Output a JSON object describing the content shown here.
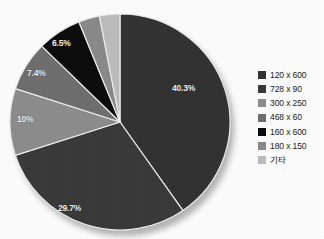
{
  "chart_data": {
    "type": "pie",
    "title": "",
    "legend_position": "right",
    "grid": false,
    "categories": [
      "120 x 600",
      "728 x 90",
      "300 x 250",
      "468 x 60",
      "160 x 600",
      "180 x 150",
      "기타"
    ],
    "values": [
      40.3,
      29.7,
      10,
      7.4,
      6.5,
      3.1,
      3.0
    ],
    "value_unit": "%",
    "labels": [
      "40.3%",
      "29.7%",
      "10%",
      "7.4%",
      "6.5%",
      "",
      ""
    ],
    "slice_colors": [
      "#333333",
      "#3a3a3a",
      "#8d8d8d",
      "#6f6f6f",
      "#0d0d0d",
      "#8a8a8a",
      "#bdbdbd"
    ],
    "start_angle_deg": 0,
    "direction": "clockwise"
  },
  "pie": {
    "labels": [
      {
        "text": "40.3%",
        "left": 172,
        "top": 83
      },
      {
        "text": "29.7%",
        "left": 58,
        "top": 203
      },
      {
        "text": "10%",
        "left": 17,
        "top": 114
      },
      {
        "text": "7.4%",
        "left": 27,
        "top": 68
      },
      {
        "text": "6.5%",
        "left": 52,
        "top": 38
      }
    ]
  },
  "legend": {
    "items": [
      {
        "label": "120 x 600",
        "color": "#333333"
      },
      {
        "label": "728 x 90",
        "color": "#3a3a3a"
      },
      {
        "label": "300 x 250",
        "color": "#8d8d8d"
      },
      {
        "label": "468 x 60",
        "color": "#6f6f6f"
      },
      {
        "label": "160 x 600",
        "color": "#0d0d0d"
      },
      {
        "label": "180 x 150",
        "color": "#8a8a8a"
      },
      {
        "label": "기타",
        "color": "#bdbdbd"
      }
    ]
  }
}
